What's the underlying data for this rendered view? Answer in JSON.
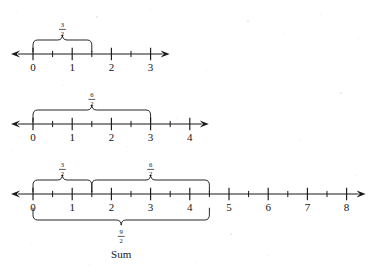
{
  "figure": {
    "background_color": "#ffffff",
    "ink_color": "#1a1a1a",
    "sum_caption": "Sum"
  },
  "chart_data": {
    "type": "line",
    "xlabel": "",
    "ylabel": "",
    "grid": false,
    "legend": "none",
    "number_lines": [
      {
        "id": "line-1",
        "xlim": [
          0,
          3
        ],
        "major_ticks": [
          0,
          1,
          2,
          3
        ],
        "tick_labels": [
          "0",
          "1",
          "2",
          "3"
        ],
        "minor_ticks": [
          0.5,
          1.5,
          2.5
        ],
        "left_arrow": true,
        "right_arrow": true,
        "braces": [
          {
            "id": "brace-three-halves-1",
            "from": 0,
            "to": 1.5,
            "direction": "up",
            "numerator": "3",
            "denominator": "2"
          }
        ]
      },
      {
        "id": "line-2",
        "xlim": [
          0,
          4
        ],
        "major_ticks": [
          0,
          1,
          2,
          3,
          4
        ],
        "tick_labels": [
          "0",
          "1",
          "2",
          "3",
          "4"
        ],
        "minor_ticks": [
          0.5,
          1.5,
          2.5,
          3.5
        ],
        "left_arrow": true,
        "right_arrow": true,
        "braces": [
          {
            "id": "brace-six-halves-2",
            "from": 0,
            "to": 3,
            "direction": "up",
            "numerator": "6",
            "denominator": "2"
          }
        ]
      },
      {
        "id": "line-3",
        "xlim": [
          0,
          8
        ],
        "major_ticks": [
          0,
          1,
          2,
          3,
          4,
          5,
          6,
          7,
          8
        ],
        "tick_labels": [
          "0",
          "1",
          "2",
          "3",
          "4",
          "5",
          "6",
          "7",
          "8"
        ],
        "minor_ticks": [
          0.5,
          1.5,
          2.5,
          3.5,
          4.5,
          5.5,
          6.5,
          7.5
        ],
        "left_arrow": true,
        "right_arrow": true,
        "braces": [
          {
            "id": "brace-three-halves-3",
            "from": 0,
            "to": 1.5,
            "direction": "up",
            "numerator": "3",
            "denominator": "2"
          },
          {
            "id": "brace-six-halves-3",
            "from": 1.5,
            "to": 4.5,
            "direction": "up",
            "numerator": "6",
            "denominator": "2"
          },
          {
            "id": "brace-sum-nine-halves",
            "from": 0,
            "to": 4.5,
            "direction": "down",
            "numerator": "9",
            "denominator": "2"
          }
        ]
      }
    ]
  }
}
